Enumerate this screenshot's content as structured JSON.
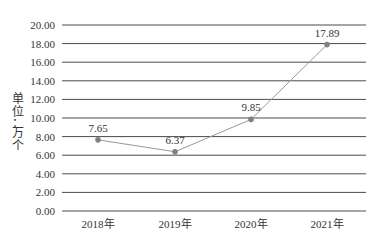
{
  "chart_data": {
    "type": "line",
    "title": "",
    "xlabel": "",
    "ylabel": "单位：万个",
    "categories": [
      "2018年",
      "2019年",
      "2020年",
      "2021年"
    ],
    "series": [
      {
        "name": "",
        "values": [
          7.65,
          6.37,
          9.85,
          17.89
        ]
      }
    ],
    "data_labels": [
      "7.65",
      "6.37",
      "9.85",
      "17.89"
    ],
    "yticks": [
      "0.00",
      "2.00",
      "4.00",
      "6.00",
      "8.00",
      "10.00",
      "12.00",
      "14.00",
      "16.00",
      "18.00",
      "20.00"
    ],
    "ylim": [
      0,
      20
    ],
    "grid": true,
    "legend": "none",
    "colors": {
      "line": "#9a9a9a",
      "marker": "#808080",
      "grid": "#4a4a4a"
    }
  },
  "ylabel_chars": [
    "单",
    "位",
    "：",
    "万",
    "个"
  ]
}
